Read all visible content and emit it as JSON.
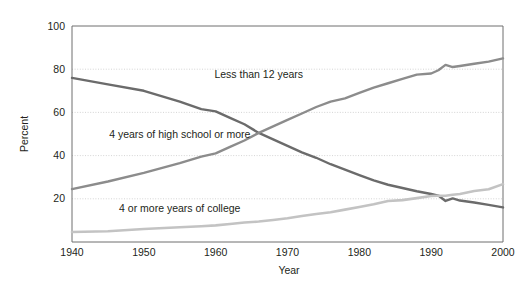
{
  "chart_data": {
    "type": "line",
    "title": "",
    "xlabel": "Year",
    "ylabel": "Percent",
    "xlim": [
      1940,
      2000
    ],
    "ylim": [
      0,
      100
    ],
    "xticks": [
      "1940",
      "1950",
      "1960",
      "1970",
      "1980",
      "1990",
      "2000"
    ],
    "yticks": [
      "20",
      "40",
      "60",
      "80",
      "100"
    ],
    "grid": "horizontal-dotted",
    "legend_position": "inline-labels",
    "x": [
      1940,
      1945,
      1950,
      1955,
      1958,
      1960,
      1962,
      1964,
      1966,
      1968,
      1970,
      1972,
      1974,
      1976,
      1978,
      1980,
      1982,
      1984,
      1986,
      1988,
      1990,
      1991,
      1992,
      1993,
      1994,
      1996,
      1998,
      2000
    ],
    "series": [
      {
        "name": "Less than 12 years",
        "color": "#6b6b6b",
        "label_x": 1966,
        "label_y": 76,
        "values": [
          76.0,
          73.0,
          70.0,
          65.0,
          61.5,
          60.5,
          57.5,
          54.5,
          50.5,
          47.5,
          44.5,
          41.5,
          39.0,
          36.0,
          33.5,
          31.0,
          28.5,
          26.5,
          25.0,
          23.5,
          22.2,
          21.5,
          19.0,
          20.2,
          19.2,
          18.3,
          17.2,
          16.0
        ]
      },
      {
        "name": "4 years of high school or more",
        "color": "#8c8c8c",
        "label_x": 1955,
        "label_y": 48,
        "values": [
          24.5,
          28.0,
          32.0,
          36.5,
          39.5,
          41.0,
          44.0,
          47.0,
          50.5,
          53.5,
          56.5,
          59.5,
          62.5,
          65.0,
          66.5,
          69.0,
          71.5,
          73.5,
          75.5,
          77.5,
          78.0,
          79.5,
          82.0,
          81.0,
          81.5,
          82.5,
          83.5,
          85.0
        ]
      },
      {
        "name": "4 or more years of college",
        "color": "#c3c3c3",
        "label_x": 1955,
        "label_y": 14,
        "values": [
          4.6,
          5.0,
          6.0,
          6.8,
          7.3,
          7.7,
          8.3,
          9.0,
          9.5,
          10.2,
          11.0,
          12.0,
          13.0,
          13.8,
          15.0,
          16.2,
          17.5,
          19.0,
          19.4,
          20.3,
          21.3,
          21.4,
          21.4,
          21.9,
          22.2,
          23.6,
          24.4,
          26.8
        ]
      }
    ]
  },
  "axis": {
    "y_title": "Percent",
    "x_title": "Year"
  }
}
